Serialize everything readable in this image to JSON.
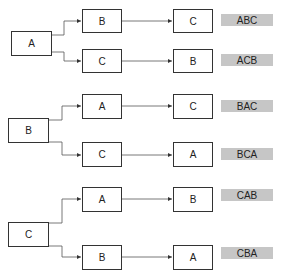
{
  "diagram": {
    "type": "permutation-tree",
    "groups": [
      {
        "root": "A",
        "branches": [
          {
            "first": "B",
            "second": "C",
            "result": "ABC"
          },
          {
            "first": "C",
            "second": "B",
            "result": "ACB"
          }
        ]
      },
      {
        "root": "B",
        "branches": [
          {
            "first": "A",
            "second": "C",
            "result": "BAC"
          },
          {
            "first": "C",
            "second": "A",
            "result": "BCA"
          }
        ]
      },
      {
        "root": "C",
        "branches": [
          {
            "first": "A",
            "second": "B",
            "result": "CAB"
          },
          {
            "first": "B",
            "second": "A",
            "result": "CBA"
          }
        ]
      }
    ],
    "colors": {
      "line": "#333333",
      "label_bg": "#c6c6c6"
    }
  }
}
